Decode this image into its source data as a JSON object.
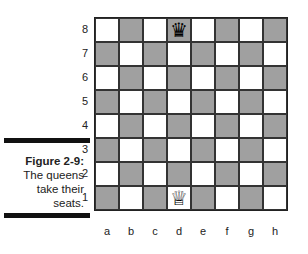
{
  "figure": {
    "label": "Figure 2-9:",
    "caption_lines": [
      "The queens",
      "take their",
      "seats."
    ]
  },
  "board": {
    "ranks": [
      "8",
      "7",
      "6",
      "5",
      "4",
      "3",
      "2",
      "1"
    ],
    "files": [
      "a",
      "b",
      "c",
      "d",
      "e",
      "f",
      "g",
      "h"
    ],
    "colors": {
      "light": "#ffffff",
      "dark": "#a0a0a0"
    },
    "pieces": [
      {
        "square": "d8",
        "piece": "black-queen",
        "glyph": "♛"
      },
      {
        "square": "d1",
        "piece": "white-queen",
        "glyph": "♕"
      }
    ]
  }
}
